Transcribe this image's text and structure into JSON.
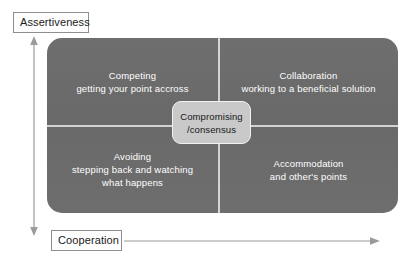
{
  "axes": {
    "vertical_label": "Assertiveness",
    "horizontal_label": "Cooperation"
  },
  "diagram": {
    "panel_color": "#6b6b6b",
    "divider_color": "#d5d5d5",
    "center_box_color": "#c9c9c9",
    "quadrant_text_color": "#ffffff",
    "center_text_color": "#171717"
  },
  "quadrants": [
    {
      "key": "competing",
      "title": "Competing",
      "subtitle": "getting your point accross"
    },
    {
      "key": "collaboration",
      "title": "Collaboration",
      "subtitle": "working to a beneficial solution"
    },
    {
      "key": "avoiding",
      "title": "Avoiding",
      "subtitle_line_1": "stepping back and watching",
      "subtitle_line_2": "what happens"
    },
    {
      "key": "accommodation",
      "title": "Accommodation",
      "subtitle": "and other's points"
    }
  ],
  "center": {
    "line_1": "Compromising",
    "line_2": "/consensus"
  }
}
